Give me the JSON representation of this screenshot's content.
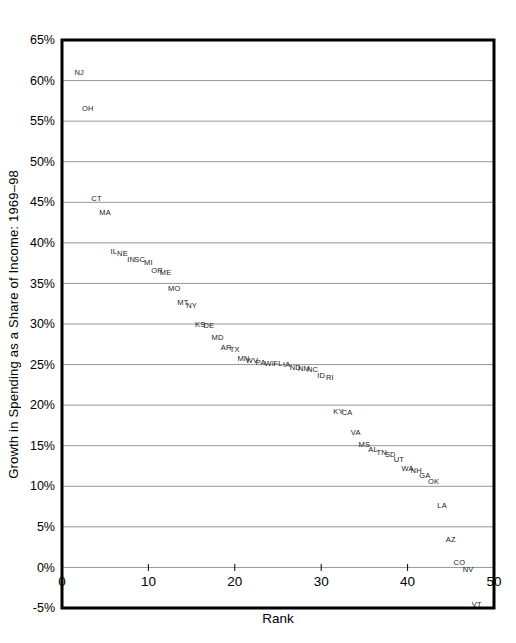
{
  "figure": {
    "background": "#ffffff",
    "border_color": "#000000",
    "grid_color": "#7a7a7a",
    "point_label_color": "#1a1a1a"
  },
  "chart_data": {
    "type": "scatter",
    "title": "",
    "xlabel": "Rank",
    "ylabel": "Growth in Spending as a Share of Income: 1969–98",
    "xlim": [
      0,
      50
    ],
    "ylim": [
      -5,
      65
    ],
    "xticks": [
      0,
      10,
      20,
      30,
      40,
      50
    ],
    "yticks": [
      65,
      60,
      55,
      50,
      45,
      40,
      35,
      30,
      25,
      20,
      15,
      10,
      5,
      0,
      -5
    ],
    "ytick_suffix": "%",
    "grid": "horizontal-only",
    "legend": "none",
    "marker": "state-abbreviation-text",
    "points": [
      {
        "state": "NJ",
        "rank": 2,
        "value": 61.0
      },
      {
        "state": "OH",
        "rank": 3,
        "value": 56.6
      },
      {
        "state": "CT",
        "rank": 4,
        "value": 45.5
      },
      {
        "state": "MA",
        "rank": 5,
        "value": 43.7
      },
      {
        "state": "IL",
        "rank": 6,
        "value": 39.0
      },
      {
        "state": "NE",
        "rank": 7,
        "value": 38.7
      },
      {
        "state": "IN",
        "rank": 8,
        "value": 38.0
      },
      {
        "state": "SC",
        "rank": 9,
        "value": 37.9
      },
      {
        "state": "MI",
        "rank": 10,
        "value": 37.6
      },
      {
        "state": "OR",
        "rank": 11,
        "value": 36.6
      },
      {
        "state": "ME",
        "rank": 12,
        "value": 36.4
      },
      {
        "state": "MO",
        "rank": 13,
        "value": 34.4
      },
      {
        "state": "MT",
        "rank": 14,
        "value": 32.7
      },
      {
        "state": "NY",
        "rank": 15,
        "value": 32.3
      },
      {
        "state": "KS",
        "rank": 16,
        "value": 29.9
      },
      {
        "state": "DE",
        "rank": 17,
        "value": 29.8
      },
      {
        "state": "MD",
        "rank": 18,
        "value": 28.4
      },
      {
        "state": "AR",
        "rank": 19,
        "value": 27.1
      },
      {
        "state": "TX",
        "rank": 20,
        "value": 26.9
      },
      {
        "state": "MN",
        "rank": 21,
        "value": 25.7
      },
      {
        "state": "WV",
        "rank": 22,
        "value": 25.5
      },
      {
        "state": "PA",
        "rank": 23,
        "value": 25.3
      },
      {
        "state": "WI",
        "rank": 24,
        "value": 25.2
      },
      {
        "state": "FL",
        "rank": 25,
        "value": 25.1
      },
      {
        "state": "IA",
        "rank": 26,
        "value": 25.0
      },
      {
        "state": "ND",
        "rank": 27,
        "value": 24.6
      },
      {
        "state": "NM",
        "rank": 28,
        "value": 24.5
      },
      {
        "state": "NC",
        "rank": 29,
        "value": 24.4
      },
      {
        "state": "ID",
        "rank": 30,
        "value": 23.7
      },
      {
        "state": "RI",
        "rank": 31,
        "value": 23.4
      },
      {
        "state": "KY",
        "rank": 32,
        "value": 19.2
      },
      {
        "state": "CA",
        "rank": 33,
        "value": 19.1
      },
      {
        "state": "VA",
        "rank": 34,
        "value": 16.7
      },
      {
        "state": "MS",
        "rank": 35,
        "value": 15.2
      },
      {
        "state": "AL",
        "rank": 36,
        "value": 14.5
      },
      {
        "state": "TN",
        "rank": 37,
        "value": 14.2
      },
      {
        "state": "SD",
        "rank": 38,
        "value": 13.9
      },
      {
        "state": "UT",
        "rank": 39,
        "value": 13.3
      },
      {
        "state": "WA",
        "rank": 40,
        "value": 12.2
      },
      {
        "state": "NH",
        "rank": 41,
        "value": 11.9
      },
      {
        "state": "GA",
        "rank": 42,
        "value": 11.3
      },
      {
        "state": "OK",
        "rank": 43,
        "value": 10.6
      },
      {
        "state": "LA",
        "rank": 44,
        "value": 7.6
      },
      {
        "state": "AZ",
        "rank": 45,
        "value": 3.5
      },
      {
        "state": "CO",
        "rank": 46,
        "value": 0.6
      },
      {
        "state": "NV",
        "rank": 47,
        "value": -0.2
      },
      {
        "state": "VT",
        "rank": 48,
        "value": -4.5
      }
    ]
  }
}
